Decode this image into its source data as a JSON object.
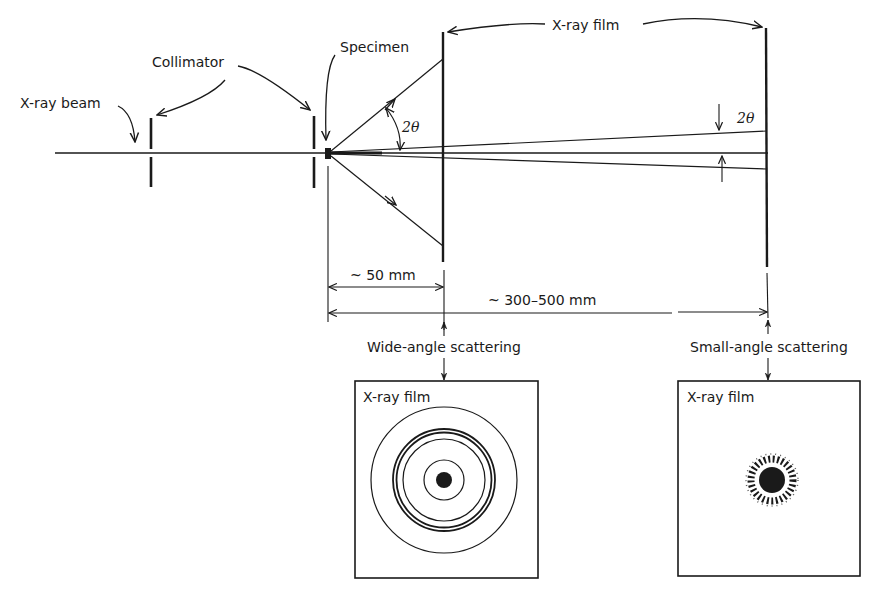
{
  "labels": {
    "xray_beam": "X-ray beam",
    "collimator": "Collimator",
    "specimen": "Specimen",
    "xray_film_top": "X-ray film",
    "angle_wide": "2θ",
    "angle_small": "2θ",
    "dist_short": "~ 50 mm",
    "dist_long": "~ 300–500 mm",
    "wide_angle": "Wide-angle scattering",
    "small_angle": "Small-angle scattering",
    "film_box_left_title": "X-ray film",
    "film_box_right_title": "X-ray film"
  },
  "colors": {
    "ink": "#1a1a1a",
    "background": "#ffffff"
  },
  "wide_angle_pattern": {
    "rings": [
      {
        "r": 73,
        "w": 1.2
      },
      {
        "r": 51,
        "w": 1.8
      },
      {
        "r": 48,
        "w": 1.8
      },
      {
        "r": 41,
        "w": 1.2
      },
      {
        "r": 20,
        "w": 1.2
      }
    ],
    "center_spot_r": 8
  },
  "small_angle_pattern": {
    "center_spot_r": 12,
    "halo_r": 24
  }
}
